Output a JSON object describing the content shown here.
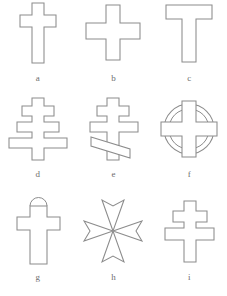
{
  "figure": {
    "background_color": "#ffffff",
    "stroke_color": "#8c8c8c",
    "fill_color": "#ffffff",
    "label_color": "#6e6e6e",
    "columns": 3,
    "rows": 3,
    "items": [
      {
        "key": "a",
        "label": "a",
        "name": "latin-cross",
        "description": "Latin cross: long vertical shaft with a single horizontal bar set above center."
      },
      {
        "key": "b",
        "label": "b",
        "name": "greek-cross",
        "description": "Greek cross: four arms of equal length meeting at the center."
      },
      {
        "key": "c",
        "label": "c",
        "name": "tau-cross",
        "description": "Tau cross: T-shaped, horizontal bar flush with the top of the shaft."
      },
      {
        "key": "d",
        "label": "d",
        "name": "papal-cross",
        "description": "Papal cross: three horizontal bars increasing in length from top to bottom."
      },
      {
        "key": "e",
        "label": "e",
        "name": "russian-orthodox-cross",
        "description": "Russian Orthodox cross: short upper bar, long middle bar, slanted lower footrest."
      },
      {
        "key": "f",
        "label": "f",
        "name": "celtic-cross",
        "description": "Celtic cross: cross enclosed by a ring at the intersection."
      },
      {
        "key": "g",
        "label": "g",
        "name": "arched-top-cross",
        "description": "Cross with a semicircular arch or loop above the upper arm."
      },
      {
        "key": "h",
        "label": "h",
        "name": "maltese-cross",
        "description": "Maltese cross: four arms flaring outward with notched V-shaped ends."
      },
      {
        "key": "i",
        "label": "i",
        "name": "patriarchal-cross",
        "description": "Patriarchal cross: short upper bar above a longer lower crossbar."
      }
    ]
  }
}
